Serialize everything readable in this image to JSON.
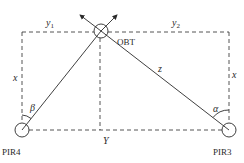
{
  "diagram": {
    "nodes": {
      "obt": {
        "label": "OBT",
        "cx": 101,
        "cy": 31,
        "r": 7
      },
      "pir4": {
        "label": "PIR4",
        "cx": 22,
        "cy": 130,
        "r": 7
      },
      "pir3": {
        "label": "PIR3",
        "cx": 229,
        "cy": 130,
        "r": 7
      }
    },
    "labels": {
      "y1": "y",
      "y1_sub": "1",
      "y2": "y",
      "y2_sub": "2",
      "x_left": "x",
      "x_right": "x",
      "z": "z",
      "y_bottom": "Y",
      "beta": "β",
      "alpha": "α"
    },
    "colors": {
      "line": "#2a2a2a",
      "background": "#ffffff"
    }
  }
}
